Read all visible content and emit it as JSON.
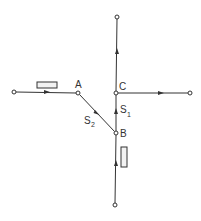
{
  "diagram": {
    "type": "network-flow",
    "stroke_color": "#333333",
    "node_labels": {
      "A": "A",
      "B": "B",
      "C": "C"
    },
    "edge_labels": {
      "s1": {
        "main": "S",
        "sub": "1"
      },
      "s2": {
        "main": "S",
        "sub": "2"
      }
    },
    "nodes": [
      {
        "id": "left-terminal",
        "label": "",
        "x": 14,
        "y": 92
      },
      {
        "id": "A",
        "label": "A",
        "x": 78,
        "y": 93
      },
      {
        "id": "C",
        "label": "C",
        "x": 116,
        "y": 93
      },
      {
        "id": "right-terminal",
        "label": "",
        "x": 190,
        "y": 93
      },
      {
        "id": "top-terminal",
        "label": "",
        "x": 117,
        "y": 17
      },
      {
        "id": "B",
        "label": "B",
        "x": 116,
        "y": 133
      },
      {
        "id": "bottom-terminal",
        "label": "",
        "x": 115,
        "y": 205
      }
    ],
    "edges": [
      {
        "from": "left-terminal",
        "to": "A",
        "arrow": "right",
        "rect": "above"
      },
      {
        "from": "A",
        "to": "B",
        "arrow": "down-right",
        "label": "S2"
      },
      {
        "from": "B",
        "to": "C",
        "arrow": "up",
        "label": "S1"
      },
      {
        "from": "C",
        "to": "top-terminal",
        "arrow": "up"
      },
      {
        "from": "C",
        "to": "right-terminal",
        "arrow": "right"
      },
      {
        "from": "bottom-terminal",
        "to": "B",
        "arrow": "up",
        "rect": "right"
      }
    ]
  }
}
